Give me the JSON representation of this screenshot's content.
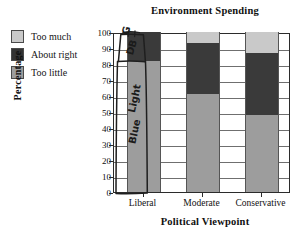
{
  "chart_data": {
    "type": "bar",
    "subtype": "stacked-bar-100",
    "title": "Environment Spending",
    "xlabel": "Political Viewpoint",
    "ylabel": "Percentage",
    "categories": [
      "Liberal",
      "Moderate",
      "Conservative"
    ],
    "series": [
      {
        "name": "Too little",
        "color": "#9d9d9d",
        "values": [
          82,
          61,
          48
        ]
      },
      {
        "name": "About right",
        "color": "#3a3a3a",
        "values": [
          18,
          32,
          39
        ]
      },
      {
        "name": "Too much",
        "color": "#c9c9c9",
        "values": [
          0,
          7,
          13
        ]
      }
    ],
    "ylim": [
      0,
      100
    ],
    "yticks": [
      0,
      10,
      20,
      30,
      40,
      50,
      60,
      70,
      80,
      90,
      100
    ],
    "grid": "horizontal",
    "legend_position": "top-left",
    "note": "Liberal bar is obscured by hand-drawn pen annotation"
  },
  "legend": {
    "items": [
      {
        "label": "Too much",
        "color": "#c9c9c9"
      },
      {
        "label": "About right",
        "color": "#333333"
      },
      {
        "label": "Too little",
        "color": "#9d9d9d"
      }
    ]
  },
  "annotations": {
    "handwriting": [
      {
        "text": "G",
        "meaning": "gray"
      },
      {
        "text": "DB",
        "meaning": "dark blue"
      },
      {
        "text": "Light",
        "meaning": "light blue line 1"
      },
      {
        "text": "Blue",
        "meaning": "light blue line 2"
      }
    ]
  }
}
